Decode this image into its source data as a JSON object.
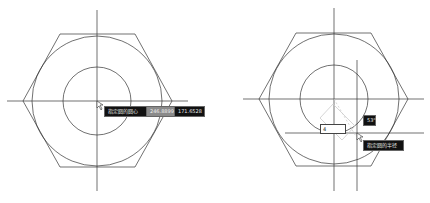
{
  "left_view": {
    "tooltip_prompt": "指定圆的圆心",
    "coord_x": "246.8899",
    "coord_y": "171.6528"
  },
  "right_view": {
    "radius_input": "4",
    "angle_label": "53°",
    "tooltip_prompt": "指定圆的半径"
  },
  "colors": {
    "line": "#333333",
    "tooltip_bg": "#111111",
    "tooltip_gray_bg": "#8a8a8a"
  }
}
